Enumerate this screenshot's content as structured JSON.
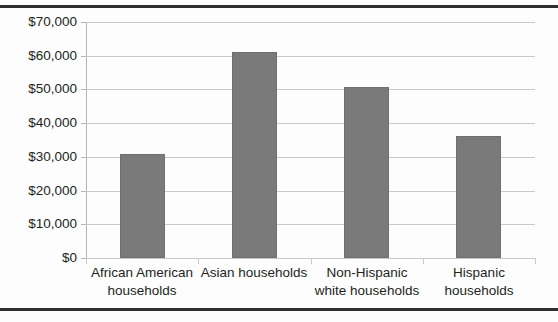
{
  "chart_data": {
    "type": "bar",
    "title": "",
    "subtitle": "",
    "xlabel": "",
    "ylabel": "",
    "categories": [
      "African American households",
      "Asian households",
      "Non-Hispanic white households",
      "Hispanic households"
    ],
    "values": [
      30900,
      61200,
      50700,
      36200
    ],
    "ylim": [
      0,
      70000
    ],
    "ytick_values": [
      0,
      10000,
      20000,
      30000,
      40000,
      50000,
      60000,
      70000
    ],
    "ytick_labels": [
      "$0",
      "$10,000",
      "$20,000",
      "$30,000",
      "$40,000",
      "$50,000",
      "$60,000",
      "$70,000"
    ],
    "grid": true,
    "legend": false,
    "legend_position": "none",
    "bar_color": "#7a7a7a",
    "gridline_color": "#c9c9c9",
    "text_color": "#231f20",
    "rule_color": "#2f2f2f"
  }
}
